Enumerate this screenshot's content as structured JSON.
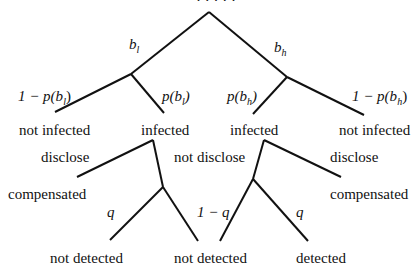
{
  "diagram": {
    "type": "probability-tree",
    "top_partial_text": "· · · · ·",
    "level1": {
      "left_branch": "b",
      "left_sub": "l",
      "right_branch": "b",
      "right_sub": "h"
    },
    "level2": {
      "ll_prob": "1 − p(b",
      "ll_sub": "l",
      "ll_close": ")",
      "lr_prob": "p(b",
      "lr_sub": "l",
      "lr_close": ")",
      "rl_prob": "p(b",
      "rl_sub": "h",
      "rl_close": ")",
      "rr_prob": "1 − p(b",
      "rr_sub": "h",
      "rr_close": ")"
    },
    "states": [
      "not infected",
      "infected",
      "infected",
      "not infected"
    ],
    "decisions": {
      "left_disclose": "disclose",
      "middle_not_disclose": "not disclose",
      "right_disclose": "disclose"
    },
    "outcomes": {
      "left_compensated": "compensated",
      "right_compensated": "compensated"
    },
    "detection_probs": {
      "left_q": "q",
      "right_one_minus_q": "1 − q",
      "right_q": "q"
    },
    "leaves": [
      "not detected",
      "not detected",
      "detected"
    ],
    "line_color": "#111111"
  }
}
